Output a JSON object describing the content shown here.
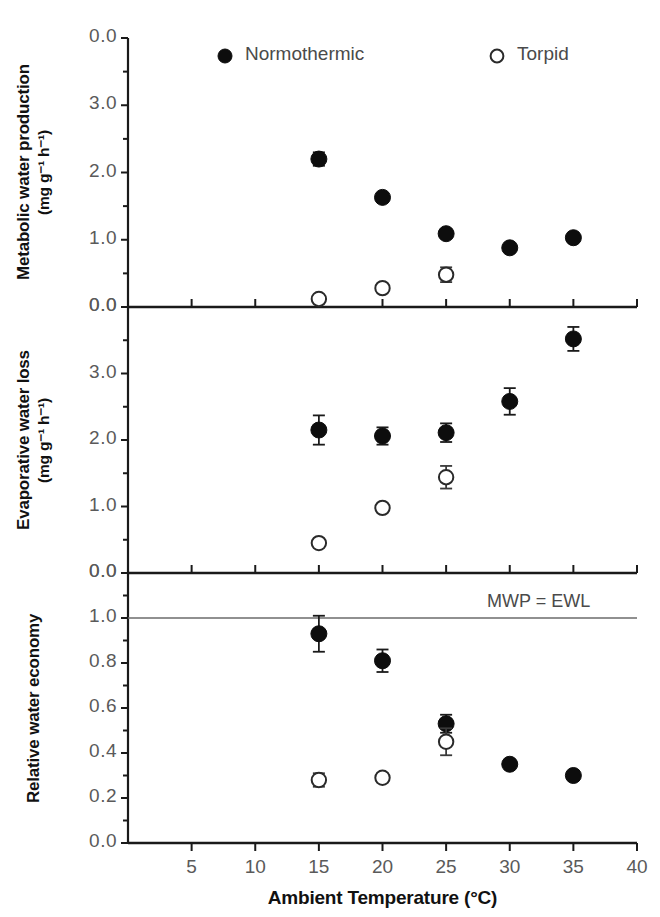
{
  "figure": {
    "xaxis": {
      "title": "Ambient Temperature (°C)",
      "ticks": [
        5,
        10,
        15,
        20,
        25,
        30,
        35,
        40
      ],
      "min": 0,
      "max": 40,
      "minor_step": 2.5
    },
    "legend": {
      "entries": [
        {
          "label": "Normothermic",
          "marker": "filled-circle"
        },
        {
          "label": "Torpid",
          "marker": "open-circle"
        }
      ]
    },
    "annotations": [
      {
        "text": "MWP = EWL",
        "panel": "relative-water-economy",
        "value": 1.0
      }
    ]
  },
  "chart_data": [
    {
      "type": "scatter",
      "panel_id": "metabolic-water-production",
      "title": "",
      "xlabel": "Ambient Temperature (°C)",
      "ylabel": "Metabolic water production (mg g⁻¹ h⁻¹)",
      "ylabel_lines": [
        "Metabolic water production",
        "(mg g⁻¹ h⁻¹)"
      ],
      "ytick_labels": [
        "0.0",
        "3.0",
        "2.0",
        "1.0",
        "0.0"
      ],
      "ytick_values": [
        4.0,
        3.0,
        2.0,
        1.0,
        0.0
      ],
      "ylim": [
        0.0,
        4.0
      ],
      "y_inverted": true,
      "grid": false,
      "legend_position": "top-inside",
      "series": [
        {
          "name": "Normothermic",
          "marker": "filled-circle",
          "x": [
            15,
            20,
            25,
            30,
            35
          ],
          "values": [
            2.2,
            1.63,
            1.09,
            0.88,
            1.03
          ],
          "yerr": [
            0.1,
            0.06,
            0.06,
            0.0,
            0.0
          ]
        },
        {
          "name": "Torpid",
          "marker": "open-circle",
          "x": [
            15,
            20,
            25
          ],
          "values": [
            0.12,
            0.28,
            0.48
          ],
          "yerr": [
            0.0,
            0.0,
            0.11
          ]
        }
      ]
    },
    {
      "type": "scatter",
      "panel_id": "evaporative-water-loss",
      "title": "",
      "xlabel": "Ambient Temperature (°C)",
      "ylabel": "Evaporative water loss (mg g⁻¹ h⁻¹)",
      "ylabel_lines": [
        "Evaporative water loss",
        "(mg g⁻¹ h⁻¹)"
      ],
      "ytick_labels": [
        "0.0",
        "3.0",
        "2.0",
        "1.0",
        "0.0"
      ],
      "ytick_values": [
        4.0,
        3.0,
        2.0,
        1.0,
        0.0
      ],
      "ylim": [
        0.0,
        4.0
      ],
      "y_inverted": true,
      "grid": false,
      "legend_position": "none",
      "series": [
        {
          "name": "Normothermic",
          "marker": "filled-circle",
          "x": [
            15,
            20,
            25,
            30,
            35
          ],
          "values": [
            2.15,
            2.06,
            2.11,
            2.58,
            3.52
          ],
          "yerr": [
            0.22,
            0.13,
            0.14,
            0.2,
            0.18
          ]
        },
        {
          "name": "Torpid",
          "marker": "open-circle",
          "x": [
            15,
            20,
            25
          ],
          "values": [
            0.45,
            0.98,
            1.44
          ],
          "yerr": [
            0.0,
            0.0,
            0.17
          ]
        }
      ]
    },
    {
      "type": "scatter",
      "panel_id": "relative-water-economy",
      "title": "",
      "xlabel": "Ambient Temperature (°C)",
      "ylabel": "Relative water economy",
      "ylabel_lines": [
        "Relative water economy"
      ],
      "ytick_labels": [
        "0.0",
        "1.0",
        "0.8",
        "0.6",
        "0.4",
        "0.2",
        "0.0"
      ],
      "ytick_values": [
        1.2,
        1.0,
        0.8,
        0.6,
        0.4,
        0.2,
        0.0
      ],
      "ylim": [
        0.0,
        1.2
      ],
      "y_inverted": true,
      "grid": false,
      "legend_position": "none",
      "reference_line": {
        "value": 1.0,
        "label": "MWP = EWL"
      },
      "series": [
        {
          "name": "Normothermic",
          "marker": "filled-circle",
          "x": [
            15,
            20,
            25,
            30,
            35
          ],
          "values": [
            0.93,
            0.81,
            0.53,
            0.35,
            0.3
          ],
          "yerr": [
            0.08,
            0.05,
            0.04,
            0.0,
            0.0
          ]
        },
        {
          "name": "Torpid",
          "marker": "open-circle",
          "x": [
            15,
            20,
            25
          ],
          "values": [
            0.28,
            0.29,
            0.45
          ],
          "yerr": [
            0.03,
            0.02,
            0.06
          ]
        }
      ]
    }
  ]
}
